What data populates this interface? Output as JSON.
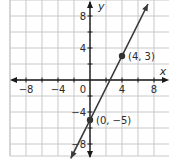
{
  "chart_data": {
    "type": "line",
    "title": "",
    "xlabel": "x",
    "ylabel": "y",
    "xlim": [
      -10,
      10
    ],
    "ylim": [
      -9.5,
      10
    ],
    "grid": true,
    "grid_step": 2,
    "x_ticks": [
      -8,
      -4,
      0,
      4,
      8
    ],
    "y_ticks": [
      8,
      4,
      -4,
      -8
    ],
    "x_tick_labels": [
      "−8",
      "−4",
      "0",
      "4",
      "8"
    ],
    "y_tick_labels": [
      "8",
      "4",
      "−4",
      "−8"
    ],
    "series": [
      {
        "name": "line",
        "equation": "y = 2x - 5",
        "slope": 2,
        "intercept": -5,
        "arrows": "both",
        "points": [
          {
            "x": 0,
            "y": -5,
            "label": "(0, −5)"
          },
          {
            "x": 4,
            "y": 3,
            "label": "(4, 3)"
          }
        ]
      }
    ],
    "colors": {
      "grid": "#c8c8c8",
      "axis": "#1a1a1a",
      "line": "#3a3a3a",
      "point": "#333333"
    }
  }
}
